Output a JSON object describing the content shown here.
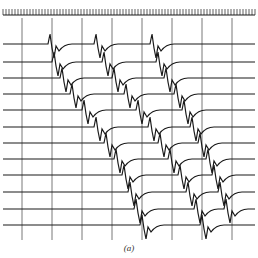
{
  "figure": {
    "caption": "(a)",
    "ruler": {
      "y": 12,
      "x_start": 3,
      "x_end": 255,
      "tick_spacing": 3
    },
    "gridlines_x": [
      22,
      52,
      82,
      112,
      142,
      172,
      202,
      232
    ],
    "gridline_span": [
      18,
      240
    ],
    "traces": {
      "baselines_y": [
        44,
        62,
        78,
        94,
        110,
        127,
        143,
        159,
        175,
        192,
        209,
        225
      ],
      "x_start": 3,
      "x_end": 255,
      "first_spike_x": [
        50,
        54,
        62,
        72,
        84,
        96,
        106,
        116,
        124,
        130,
        136,
        142
      ],
      "second_spike_x": [
        96,
        104,
        114,
        126,
        138,
        150,
        160,
        170,
        180,
        188,
        196,
        202
      ],
      "third_spike_x": [
        152,
        158,
        166,
        176,
        184,
        192,
        200,
        208,
        214,
        220,
        226,
        230
      ]
    },
    "colors": {
      "ink": "#1a1a1a",
      "grid": "#555555",
      "background": "#ffffff"
    }
  }
}
